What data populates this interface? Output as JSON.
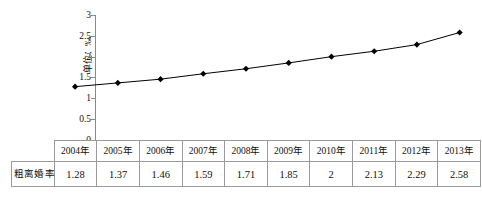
{
  "chart_data": {
    "type": "line",
    "title": "",
    "xlabel": "",
    "ylabel": "单位：‰",
    "ylim": [
      0,
      3
    ],
    "yticks": [
      "0",
      "0.5",
      "1",
      "1.5",
      "2",
      "2.5",
      "3"
    ],
    "grid": false,
    "legend_position": "table-row-left",
    "categories": [
      "2004年",
      "2005年",
      "2006年",
      "2007年",
      "2008年",
      "2009年",
      "2010年",
      "2011年",
      "2012年",
      "2013年"
    ],
    "series": [
      {
        "name": "粗离婚率",
        "values": [
          1.28,
          1.37,
          1.46,
          1.59,
          1.71,
          1.85,
          2,
          2.13,
          2.29,
          2.58
        ],
        "value_labels": [
          "1.28",
          "1.37",
          "1.46",
          "1.59",
          "1.71",
          "1.85",
          "2",
          "2.13",
          "2.29",
          "2.58"
        ],
        "marker": "diamond",
        "color": "#000000"
      }
    ]
  },
  "axis": {
    "y_label": "单位：‰",
    "y_ticks": [
      {
        "label": "3",
        "value": 3
      },
      {
        "label": "2.5",
        "value": 2.5
      },
      {
        "label": "2",
        "value": 2
      },
      {
        "label": "1.5",
        "value": 1.5
      },
      {
        "label": "1",
        "value": 1
      },
      {
        "label": "0.5",
        "value": 0.5
      },
      {
        "label": "0",
        "value": 0
      }
    ]
  },
  "table": {
    "header": [
      "2004年",
      "2005年",
      "2006年",
      "2007年",
      "2008年",
      "2009年",
      "2010年",
      "2011年",
      "2012年",
      "2013年"
    ],
    "legend_label": "粗离婚率",
    "legend_marker": "diamond-line-marker",
    "values": [
      "1.28",
      "1.37",
      "1.46",
      "1.59",
      "1.71",
      "1.85",
      "2",
      "2.13",
      "2.29",
      "2.58"
    ]
  },
  "colors": {
    "series": "#000000",
    "axis": "#8a8a8a",
    "table_border": "#9a9a9a",
    "text": "#111111",
    "background": "#ffffff"
  }
}
